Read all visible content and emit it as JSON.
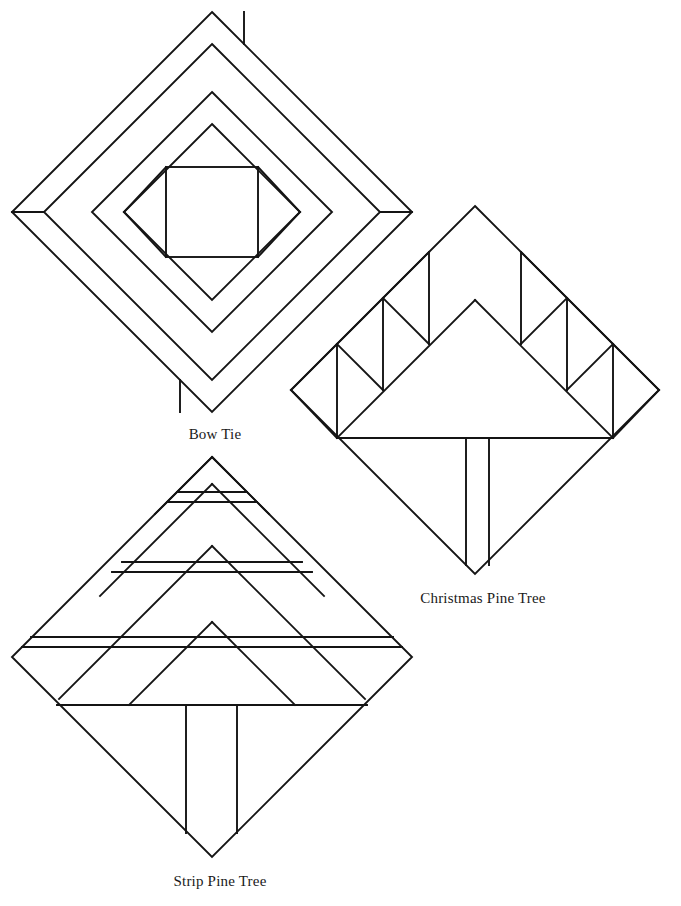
{
  "page": {
    "background_color": "#ffffff",
    "stroke_color": "#141414",
    "width": 681,
    "height": 906
  },
  "blocks": [
    {
      "id": "bow-tie",
      "label": "Bow Tie",
      "kind": "quilt-block-diagram",
      "shape": "rotated-square-diamond",
      "center": [
        212,
        212
      ],
      "half_diagonal": 200,
      "label_position": [
        212,
        434
      ],
      "description": "Concentric diamond frames around an axis-aligned center square",
      "rings": [
        200,
        168,
        120,
        88
      ],
      "center_square": {
        "x": 165,
        "y": 168,
        "size": 92
      }
    },
    {
      "id": "christmas-pine-tree",
      "label": "Christmas Pine Tree",
      "kind": "quilt-block-diagram",
      "shape": "rotated-square-diamond",
      "center": [
        475,
        390
      ],
      "half_diagonal": 184,
      "label_position": [
        483,
        598
      ],
      "description": "Large central triangle with sawtooth half-square-triangle branches and a trunk",
      "baseline_y": 438,
      "trunk": {
        "left_x": 466,
        "right_x": 489,
        "top_y": 438,
        "bottom_y": 568
      },
      "sawtooth_units": 3
    },
    {
      "id": "strip-pine-tree",
      "label": "Strip Pine Tree",
      "kind": "quilt-block-diagram",
      "shape": "rotated-square-diamond",
      "center": [
        212,
        657
      ],
      "half_diagonal": 200,
      "label_position": [
        220,
        881
      ],
      "description": "Four nested strip-pieced triangle tiers above a trunk",
      "tiers": 4,
      "strip_rows_y": [
        492,
        502,
        562,
        572,
        637,
        647,
        705
      ],
      "trunk": {
        "left_x": 186,
        "right_x": 237,
        "top_y": 705,
        "bottom_y": 836
      }
    }
  ],
  "labels": {
    "bow_tie": "Bow Tie",
    "christmas_pine_tree": "Christmas Pine Tree",
    "strip_pine_tree": "Strip Pine Tree"
  }
}
